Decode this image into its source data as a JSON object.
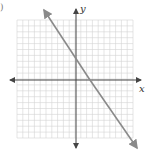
{
  "diagram": {
    "type": "coordinate-plane",
    "corner_label": ")",
    "axes": {
      "x_label": "x",
      "y_label": "y"
    },
    "grid": {
      "cells_x": 20,
      "cells_y": 20,
      "color": "#d4d4d4"
    },
    "line": {
      "description": "decreasing line, y-intercept above origin, x-intercept right of origin",
      "color": "#8a8a8a"
    },
    "colors": {
      "axis": "#444444",
      "grid": "#d4d4d4",
      "line": "#8a8a8a"
    }
  }
}
